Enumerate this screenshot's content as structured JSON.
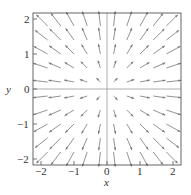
{
  "chart_data": {
    "type": "quiver",
    "title": "",
    "xlabel": "x",
    "ylabel": "y",
    "xlim": [
      -2.2,
      2.2
    ],
    "ylim": [
      -2.2,
      2.2
    ],
    "xticks": [
      "-2",
      "-1",
      "0",
      "1",
      "2"
    ],
    "yticks": [
      "-2",
      "-1",
      "0",
      "1",
      "2"
    ],
    "field": "F(x,y) = (x, y) radial outward from origin",
    "grid_points": [
      -1.8,
      -1.4,
      -1.0,
      -0.6,
      -0.2,
      0.2,
      0.6,
      1.0,
      1.4,
      1.8
    ],
    "arrow_color": "#777777",
    "axes_lines_through_origin": true
  }
}
